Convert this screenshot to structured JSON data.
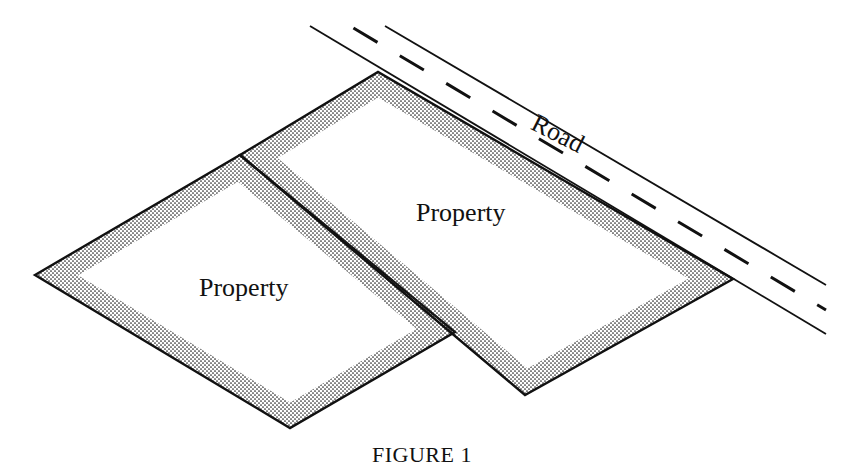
{
  "figure": {
    "caption": "FIGURE 1",
    "labels": {
      "road": "Road",
      "property_left": "Property",
      "property_right": "Property"
    },
    "colors": {
      "ink": "#111111",
      "background": "#ffffff"
    }
  }
}
